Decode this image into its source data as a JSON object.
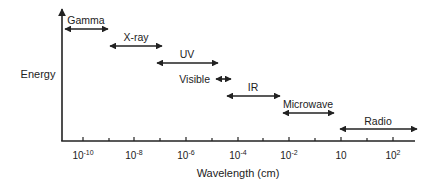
{
  "diagram": {
    "colors": {
      "ink": "#222222",
      "background": "#ffffff"
    },
    "y_axis": {
      "label": "Energy",
      "direction": "up-arrow"
    },
    "x_axis": {
      "label": "Wavelength (cm)",
      "ticks": [
        {
          "base": "10",
          "exp": "-10"
        },
        {
          "base": "10",
          "exp": "-8"
        },
        {
          "base": "10",
          "exp": "-6"
        },
        {
          "base": "10",
          "exp": "-4"
        },
        {
          "base": "10",
          "exp": "-2"
        },
        {
          "base": "10",
          "exp": ""
        },
        {
          "base": "10",
          "exp": "2"
        }
      ]
    },
    "bands": [
      {
        "label": "Gamma",
        "icon": "double-headed-arrow"
      },
      {
        "label": "X-ray",
        "icon": "double-headed-arrow"
      },
      {
        "label": "UV",
        "icon": "double-headed-arrow"
      },
      {
        "label": "Visible",
        "icon": "double-headed-arrow"
      },
      {
        "label": "IR",
        "icon": "double-headed-arrow"
      },
      {
        "label": "Microwave",
        "icon": "double-headed-arrow"
      },
      {
        "label": "Radio",
        "icon": "double-headed-arrow"
      }
    ]
  }
}
